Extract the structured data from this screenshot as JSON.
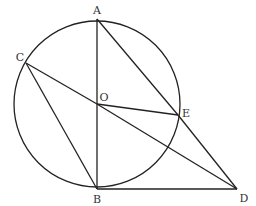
{
  "diagram": {
    "type": "geometry",
    "stroke_color": "#222222",
    "circle": {
      "center": "O",
      "cx": 97,
      "cy": 104,
      "r": 83
    },
    "points": {
      "A": {
        "label": "A",
        "x": 97,
        "y": 19,
        "lx": 97,
        "ly": 14
      },
      "B": {
        "label": "B",
        "x": 97,
        "y": 189,
        "lx": 97,
        "ly": 203
      },
      "O": {
        "label": "O",
        "x": 97,
        "y": 104,
        "lx": 104,
        "ly": 101
      },
      "C": {
        "label": "C",
        "x": 26,
        "y": 63,
        "lx": 20,
        "ly": 61
      },
      "E": {
        "label": "E",
        "x": 178,
        "y": 115,
        "lx": 186,
        "ly": 117
      },
      "D": {
        "label": "D",
        "x": 237,
        "y": 189,
        "lx": 244,
        "ly": 202
      }
    },
    "segments": [
      [
        "A",
        "B"
      ],
      [
        "A",
        "E"
      ],
      [
        "E",
        "D"
      ],
      [
        "B",
        "D"
      ],
      [
        "C",
        "O"
      ],
      [
        "O",
        "D"
      ],
      [
        "O",
        "E"
      ],
      [
        "C",
        "B"
      ]
    ]
  }
}
